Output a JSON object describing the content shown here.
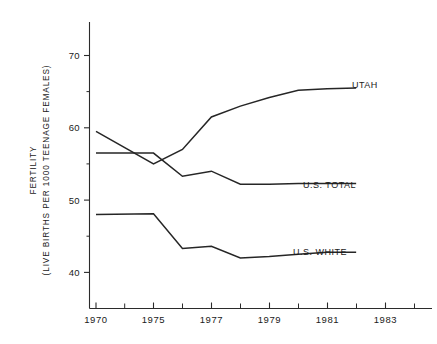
{
  "chart_data": {
    "type": "line",
    "title": "",
    "subtitle": "",
    "ylabel_line1": "FERTILITY",
    "ylabel_line2": "(LIVE BIRTHS PER 1000 TEENAGE FEMALES)",
    "xlabel": "",
    "grid": false,
    "legend_position": "right-inline-labels",
    "ylim": [
      33,
      75
    ],
    "yticks_major": [
      40,
      50,
      60,
      70
    ],
    "yticks_major_labels": [
      "40",
      "50",
      "60",
      "70"
    ],
    "yticks_minor": [
      35,
      45,
      55,
      65
    ],
    "xlim_years": [
      1970,
      1983
    ],
    "x_axis_note": "1970 plotted at a compressed offset; 1975-1983 evenly spaced one year per tick",
    "xticks_major": [
      1970,
      1975,
      1977,
      1979,
      1981,
      1983
    ],
    "xticks_major_labels": [
      "1970",
      "1975",
      "1977",
      "1979",
      "1981",
      "1983"
    ],
    "xticks_minor": [
      1976,
      1978,
      1980,
      1982
    ],
    "x": [
      1970,
      1975,
      1976,
      1977,
      1978,
      1979,
      1980,
      1981,
      1982
    ],
    "series": [
      {
        "name": "UTAH",
        "label": "UTAH",
        "values": [
          59.5,
          55.0,
          57.0,
          61.5,
          63.0,
          64.2,
          65.2,
          65.4,
          65.5
        ]
      },
      {
        "name": "U.S. TOTAL",
        "label": "U.S. TOTAL",
        "values": [
          56.5,
          56.5,
          53.3,
          54.0,
          52.2,
          52.2,
          52.3,
          52.3,
          52.3
        ]
      },
      {
        "name": "U.S. WHITE",
        "label": "U.S. WHITE",
        "values": [
          48.0,
          48.1,
          43.3,
          43.6,
          42.0,
          42.2,
          42.5,
          42.8,
          42.8
        ]
      }
    ],
    "colors": {
      "line": "#262626",
      "axis": "#2b2b2b",
      "background": "#ffffff",
      "text": "#1a1a1a"
    }
  }
}
